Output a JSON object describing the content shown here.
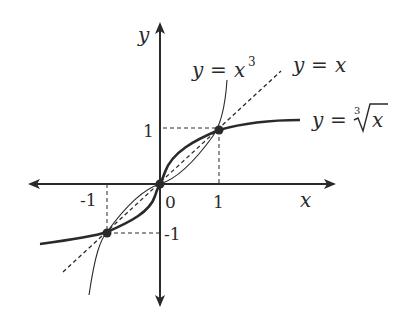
{
  "diagram": {
    "axes": {
      "x_label": "x",
      "y_label": "y",
      "x_ticks": [
        "-1",
        "0",
        "1"
      ],
      "y_ticks": [
        "1",
        "-1"
      ]
    },
    "curves": [
      {
        "name": "cube",
        "label_lhs": "y",
        "label_eq": "=",
        "label_rhs": "x",
        "label_sup": "3",
        "style": "thin solid"
      },
      {
        "name": "identity",
        "label_lhs": "y",
        "label_eq": "=",
        "label_rhs": "x",
        "style": "dashed"
      },
      {
        "name": "cube-root",
        "label_lhs": "y",
        "label_eq": "=",
        "label_index": "3",
        "label_rhs": "x",
        "style": "thick solid"
      }
    ],
    "intersection_points": [
      {
        "x": -1,
        "y": -1
      },
      {
        "x": 0,
        "y": 0
      },
      {
        "x": 1,
        "y": 1
      }
    ],
    "colors": {
      "ink": "#2a2a2a",
      "background": "#ffffff"
    }
  }
}
